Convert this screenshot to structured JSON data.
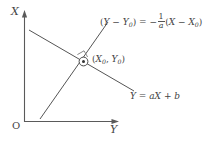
{
  "figure": {
    "background_color": "#ffffff",
    "stroke_color": "#555555",
    "text_color": "#444444"
  },
  "axes": {
    "vertical_label": "X",
    "horizontal_label": "Y",
    "origin_label": "O"
  },
  "labels": {
    "perpendicular_equation": {
      "lhs_open": "(",
      "lhs_y": "Y",
      "lhs_minus": " − ",
      "lhs_y0": "Y",
      "lhs_y0_sub": "0",
      "lhs_close": ")",
      "equals": " = ",
      "minus_sign": "−",
      "frac_num": "1",
      "frac_den": "a",
      "rhs_open": "(",
      "rhs_x": "X",
      "rhs_minus": " − ",
      "rhs_x0": "X",
      "rhs_x0_sub": "0",
      "rhs_close": ")",
      "plain": "(Y − Y0) = − (1/a) (X − X0)"
    },
    "line_equation": {
      "y": "Y",
      "equals": " = ",
      "a": "a",
      "x": "X",
      "plus": " + ",
      "b": "b",
      "plain": "Y = aX + b"
    },
    "point_label": {
      "open": "(",
      "x": "X",
      "x_sub": "0",
      "comma": ", ",
      "y": "Y",
      "y_sub": "0",
      "close": ")",
      "plain": "(X0, Y0)"
    }
  },
  "markers": {
    "intersection_point": "point-marker",
    "right_angle": "right-angle-marker"
  }
}
